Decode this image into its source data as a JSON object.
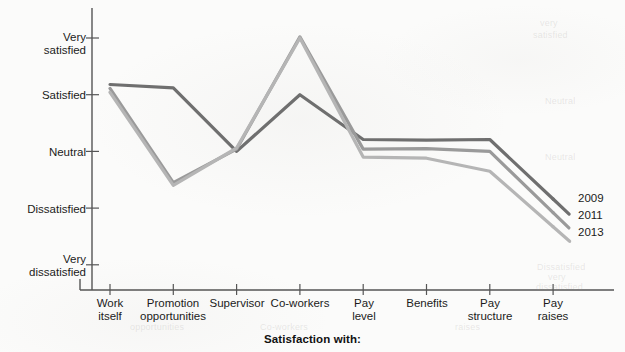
{
  "chart_data": {
    "type": "line",
    "title": "",
    "xlabel": "Satisfaction with:",
    "ylabel": "",
    "categories": [
      "Work itself",
      "Promotion opportunities",
      "Supervisor",
      "Co-workers",
      "Pay level",
      "Benefits",
      "Pay structure",
      "Pay raises"
    ],
    "category_lines": [
      [
        "Work",
        "itself"
      ],
      [
        "Promotion",
        "opportunities"
      ],
      [
        "Supervisor",
        ""
      ],
      [
        "Co-workers",
        ""
      ],
      [
        "Pay",
        "level"
      ],
      [
        "Benefits",
        ""
      ],
      [
        "Pay",
        "structure"
      ],
      [
        "Pay",
        "raises"
      ]
    ],
    "ytick_labels": [
      [
        "Very",
        "satisfied"
      ],
      [
        "Satisfied",
        ""
      ],
      [
        "Neutral",
        ""
      ],
      [
        "Dissatisfied",
        ""
      ],
      [
        "Very",
        "dissatisfied"
      ]
    ],
    "ytick_values": [
      5,
      4,
      3,
      2,
      1
    ],
    "ylim": [
      1,
      5
    ],
    "grid": false,
    "legend_position": "right-inline-end-of-lines",
    "series": [
      {
        "name": "2009",
        "color": "#6f6f6f",
        "values": [
          4.18,
          4.12,
          3.0,
          4.0,
          3.21,
          3.2,
          3.21,
          2.16
        ]
      },
      {
        "name": "2011",
        "color": "#9a9a9a",
        "values": [
          4.11,
          2.45,
          3.04,
          5.02,
          3.04,
          3.05,
          3.0,
          1.92
        ]
      },
      {
        "name": "2013",
        "color": "#b5b5b5",
        "values": [
          4.04,
          2.4,
          3.06,
          5.0,
          2.9,
          2.88,
          2.65,
          1.67
        ]
      }
    ]
  },
  "legend": {
    "items": [
      {
        "label": "2009"
      },
      {
        "label": "2011"
      },
      {
        "label": "2013"
      }
    ]
  },
  "axis": {
    "x_title": "Satisfaction with:"
  },
  "ghost": {
    "items": [
      "very",
      "satisfied",
      "Neutral",
      "Neutral",
      "Dissatisfied",
      "very",
      "dissatisfied",
      "opportunities",
      "Co-workers",
      "raises"
    ]
  }
}
